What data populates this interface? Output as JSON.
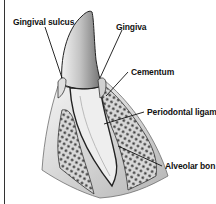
{
  "diagram": {
    "labels": [
      {
        "id": "gingival-sulcus",
        "text": "Gingival sulcus"
      },
      {
        "id": "gingiva",
        "text": "Gingiva"
      },
      {
        "id": "cementum",
        "text": "Cementum"
      },
      {
        "id": "periodontal-ligament",
        "text": "Periodontal ligame"
      },
      {
        "id": "alveolar-bone",
        "text": "Alveolar bon"
      }
    ],
    "colors": {
      "line": "#111111",
      "enamel": "#9a9a9a",
      "dentin": "#eeeeee",
      "bone_fill": "#d6d6d6",
      "bone_dots": "#3a3a3a",
      "background": "#ffffff"
    }
  }
}
